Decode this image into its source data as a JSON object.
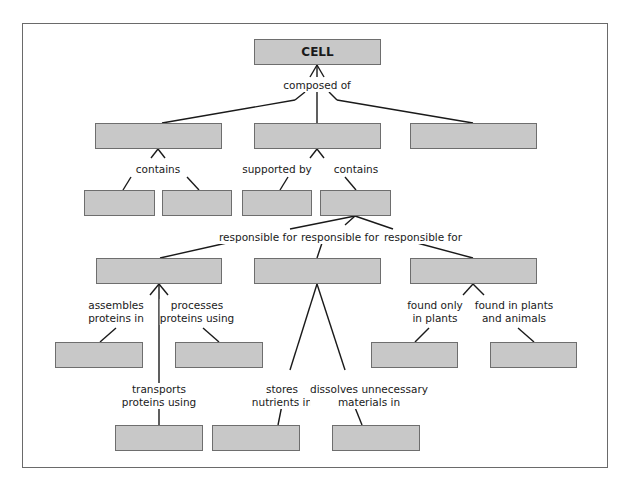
{
  "diagram": {
    "type": "concept-map",
    "root": {
      "id": "cell",
      "label": "CELL"
    },
    "nodes": [
      {
        "id": "cell",
        "label": "CELL",
        "x": 254,
        "y": 39,
        "w": 127,
        "h": 26
      },
      {
        "id": "r2a",
        "label": "",
        "x": 95,
        "y": 123,
        "w": 127,
        "h": 26
      },
      {
        "id": "r2b",
        "label": "",
        "x": 254,
        "y": 123,
        "w": 127,
        "h": 26
      },
      {
        "id": "r2c",
        "label": "",
        "x": 410,
        "y": 123,
        "w": 127,
        "h": 26
      },
      {
        "id": "r3a",
        "label": "",
        "x": 84,
        "y": 190,
        "w": 71,
        "h": 26
      },
      {
        "id": "r3b",
        "label": "",
        "x": 162,
        "y": 190,
        "w": 70,
        "h": 26
      },
      {
        "id": "r3c",
        "label": "",
        "x": 242,
        "y": 190,
        "w": 70,
        "h": 26
      },
      {
        "id": "r3d",
        "label": "",
        "x": 320,
        "y": 190,
        "w": 71,
        "h": 26
      },
      {
        "id": "r4a",
        "label": "",
        "x": 96,
        "y": 258,
        "w": 126,
        "h": 26
      },
      {
        "id": "r4b",
        "label": "",
        "x": 254,
        "y": 258,
        "w": 127,
        "h": 26
      },
      {
        "id": "r4c",
        "label": "",
        "x": 410,
        "y": 258,
        "w": 127,
        "h": 26
      },
      {
        "id": "r5a",
        "label": "",
        "x": 55,
        "y": 342,
        "w": 88,
        "h": 26
      },
      {
        "id": "r5b",
        "label": "",
        "x": 175,
        "y": 342,
        "w": 88,
        "h": 26
      },
      {
        "id": "r5c",
        "label": "",
        "x": 371,
        "y": 342,
        "w": 87,
        "h": 26
      },
      {
        "id": "r5d",
        "label": "",
        "x": 490,
        "y": 342,
        "w": 87,
        "h": 26
      },
      {
        "id": "r6a",
        "label": "",
        "x": 115,
        "y": 425,
        "w": 88,
        "h": 26
      },
      {
        "id": "r6b",
        "label": "",
        "x": 212,
        "y": 425,
        "w": 88,
        "h": 26
      },
      {
        "id": "r6c",
        "label": "",
        "x": 332,
        "y": 425,
        "w": 88,
        "h": 26
      }
    ],
    "link_labels": [
      {
        "id": "composed",
        "text": "composed of",
        "x": 317,
        "y": 79
      },
      {
        "id": "contains1",
        "text": "contains",
        "x": 158,
        "y": 163
      },
      {
        "id": "supported",
        "text": "supported by",
        "x": 277,
        "y": 163
      },
      {
        "id": "contains2",
        "text": "contains",
        "x": 356,
        "y": 163
      },
      {
        "id": "resp1",
        "text": "responsible for",
        "x": 258,
        "y": 231
      },
      {
        "id": "resp2",
        "text": "responsible for",
        "x": 340,
        "y": 231
      },
      {
        "id": "resp3",
        "text": "responsible for",
        "x": 423,
        "y": 231
      },
      {
        "id": "assembles",
        "text": "assembles\nproteins in",
        "x": 116,
        "y": 299
      },
      {
        "id": "processes",
        "text": "processes\nproteins using",
        "x": 197,
        "y": 299
      },
      {
        "id": "foundonly",
        "text": "found only\nin plants",
        "x": 435,
        "y": 299
      },
      {
        "id": "foundboth",
        "text": "found in plants\nand animals",
        "x": 514,
        "y": 299
      },
      {
        "id": "transports",
        "text": "transports\nproteins using",
        "x": 159,
        "y": 383
      },
      {
        "id": "stores",
        "text": "stores\nnutrients in",
        "x": 282,
        "y": 383
      },
      {
        "id": "dissolves",
        "text": "dissolves unnecessary\nmaterials in",
        "x": 369,
        "y": 383
      }
    ],
    "edges": [
      [
        317,
        65,
        310,
        77
      ],
      [
        317,
        65,
        317,
        77
      ],
      [
        317,
        65,
        324,
        77
      ],
      [
        305,
        92,
        295,
        100
      ],
      [
        295,
        100,
        162,
        123
      ],
      [
        317,
        92,
        317,
        123
      ],
      [
        329,
        92,
        337,
        100
      ],
      [
        337,
        100,
        473,
        123
      ],
      [
        158,
        149,
        151,
        158
      ],
      [
        158,
        149,
        165,
        158
      ],
      [
        131,
        177,
        123,
        190
      ],
      [
        187,
        177,
        199,
        190
      ],
      [
        317,
        149,
        310,
        158
      ],
      [
        317,
        149,
        324,
        158
      ],
      [
        288,
        177,
        280,
        190
      ],
      [
        345,
        177,
        356,
        190
      ],
      [
        355,
        216,
        290,
        229
      ],
      [
        355,
        216,
        345,
        225
      ],
      [
        355,
        216,
        393,
        229
      ],
      [
        240,
        240,
        160,
        258
      ],
      [
        323,
        240,
        317,
        258
      ],
      [
        406,
        240,
        473,
        258
      ],
      [
        159,
        284,
        150,
        295
      ],
      [
        159,
        284,
        168,
        295
      ],
      [
        159,
        284,
        159,
        427
      ],
      [
        116,
        328,
        100,
        342
      ],
      [
        203,
        328,
        219,
        342
      ],
      [
        317,
        284,
        290,
        370
      ],
      [
        317,
        284,
        345,
        370
      ],
      [
        282,
        405,
        278,
        425
      ],
      [
        354,
        405,
        362,
        425
      ],
      [
        473,
        284,
        463,
        295
      ],
      [
        473,
        284,
        484,
        295
      ],
      [
        429,
        328,
        415,
        342
      ],
      [
        518,
        328,
        534,
        342
      ]
    ],
    "colors": {
      "box_fill": "#c8c8c8",
      "box_border": "#6e6e6e",
      "line": "#1a1a1a",
      "frame": "#6a6a6a"
    }
  }
}
